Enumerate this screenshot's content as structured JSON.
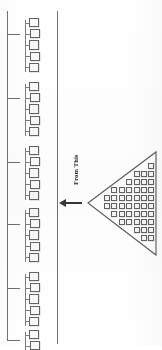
{
  "diagram": {
    "title": "From This",
    "caption_text": "From This",
    "ink_color": "#2e2e2e",
    "line_color": "#6d6d6d",
    "cell_border_color": "#5f5f5f",
    "background_color": "#ffffff"
  },
  "arrow": {
    "name": "left-arrow",
    "direction": "left",
    "label": "From This"
  },
  "left_strip": {
    "name": "linear-array-strip",
    "rail_left_label": "left-rail",
    "rail_right_label": "right-rail",
    "group_count": 8,
    "cells_per_group": 5,
    "tick_count": 6,
    "groups": [
      {
        "top": 18,
        "cells": 5
      },
      {
        "top": 82,
        "cells": 5
      },
      {
        "top": 146,
        "cells": 5
      },
      {
        "top": 208,
        "cells": 5
      },
      {
        "top": 272,
        "cells": 5
      },
      {
        "top": 330,
        "cells": 2
      }
    ],
    "ticks": [
      34,
      98,
      162,
      224,
      288,
      340
    ]
  },
  "triangle": {
    "name": "triangular-array",
    "orientation": "apex-left",
    "apex_x": 2,
    "apex_y": 55,
    "top_right_x": 70,
    "top_right_y": 4,
    "bottom_right_x": 70,
    "bottom_right_y": 107,
    "row_count": 12,
    "total_cells": 57,
    "rows": [
      {
        "y": 8,
        "count": 1
      },
      {
        "y": 17,
        "count": 2
      },
      {
        "y": 26,
        "count": 3
      },
      {
        "y": 35,
        "count": 4
      },
      {
        "y": 44,
        "count": 5
      },
      {
        "y": 53,
        "count": 6
      },
      {
        "y": 62,
        "count": 6
      },
      {
        "y": 71,
        "count": 5
      },
      {
        "y": 80,
        "count": 4
      },
      {
        "y": 89,
        "count": 3
      },
      {
        "y": 97,
        "count": 2
      }
    ]
  }
}
